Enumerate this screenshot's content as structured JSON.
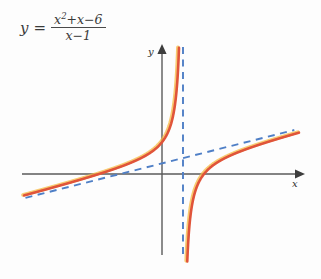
{
  "equation": {
    "lhs": "y",
    "equals": "=",
    "numerator_a": "x",
    "numerator_exp": "2",
    "numerator_b": "+x−6",
    "denominator": "x−1",
    "plain": "y = (x^2+x-6)/(x-1)"
  },
  "axes": {
    "x_label": "x",
    "y_label": "y",
    "x_axis_color": "#5a5a5a",
    "y_axis_color": "#5a5a5a"
  },
  "colors": {
    "curve": "#e0543a",
    "curve_highlight": "#f5b942",
    "asymptote": "#4f7fc6",
    "axis": "#5a5a5a",
    "text": "#3a3a3a",
    "background": "#fdfdfd"
  },
  "chart_data": {
    "type": "line",
    "title": "",
    "subtitle": "",
    "xlabel": "x",
    "ylabel": "y",
    "grid": false,
    "legend": null,
    "function": "y = (x^2 + x - 6) / (x - 1)",
    "xlim": [
      -6.8,
      6.8
    ],
    "ylim": [
      -11.0,
      11.0
    ],
    "x_axis_pixel_y": 174,
    "y_axis_pixel_x": 162,
    "pixels_per_x_unit": 21.0,
    "pixels_per_y_unit": 5.3,
    "x_intercepts": [
      -3,
      2
    ],
    "y_intercept": 6,
    "asymptotes": [
      {
        "name": "vertical-asymptote",
        "type": "vertical",
        "equation": "x = 1",
        "x": 1,
        "style": "dashed",
        "color": "#4f7fc6"
      },
      {
        "name": "slant-asymptote",
        "type": "slant",
        "equation": "y = x + 2",
        "slope": 1,
        "intercept": 2,
        "style": "dashed",
        "color": "#4f7fc6"
      }
    ],
    "branches": [
      {
        "name": "left-branch",
        "domain": [
          -6.6,
          0.82
        ],
        "description": "increasing from lower-left, crosses x-axis at x = -3, passes y-intercept at y = 6, rises steeply toward vertical asymptote x = 1"
      },
      {
        "name": "right-branch",
        "domain": [
          1.18,
          6.6
        ],
        "description": "comes up from negative infinity near x = 1, crosses x-axis at x = 2, then rises approaching slant asymptote y = x + 2 from below"
      }
    ],
    "sample_points": [
      {
        "x": -6,
        "y": 3.43
      },
      {
        "x": -5,
        "y": 2.33
      },
      {
        "x": -4,
        "y": 1.2
      },
      {
        "x": -3,
        "y": 0
      },
      {
        "x": -2,
        "y": -1.33
      },
      {
        "x": -1,
        "y": -3
      },
      {
        "x": 0,
        "y": 6
      },
      {
        "x": 0.5,
        "y": 10.5
      },
      {
        "x": 1.5,
        "y": -5.25
      },
      {
        "x": 2,
        "y": 0
      },
      {
        "x": 3,
        "y": 3
      },
      {
        "x": 4,
        "y": 4.67
      },
      {
        "x": 5,
        "y": 6
      },
      {
        "x": 6,
        "y": 7.2
      }
    ]
  }
}
